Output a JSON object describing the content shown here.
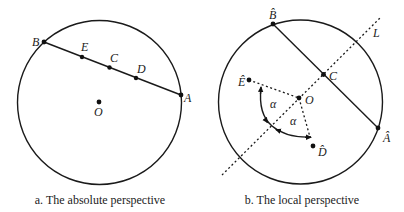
{
  "panels": [
    {
      "id": "a",
      "caption": "a. The absolute perspective",
      "points": {
        "B": "B",
        "E": "E",
        "C": "C",
        "D": "D",
        "A": "A",
        "O": "O"
      }
    },
    {
      "id": "b",
      "caption": "b. The local perspective",
      "points": {
        "B_hat": "B̂",
        "A_hat": "Â",
        "C": "C",
        "O": "O",
        "E_hat": "Ê",
        "D_hat": "D̂",
        "L": "L"
      },
      "angles": {
        "alpha_1": "α",
        "alpha_2": "α"
      }
    }
  ]
}
